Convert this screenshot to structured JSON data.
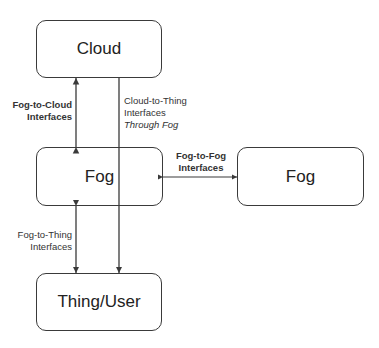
{
  "diagram": {
    "nodes": {
      "cloud": {
        "label": "Cloud"
      },
      "fog_left": {
        "label": "Fog"
      },
      "fog_right": {
        "label": "Fog"
      },
      "thing_user": {
        "label": "Thing/User"
      }
    },
    "edges": {
      "fog_to_cloud": {
        "line1": "Fog-to-Cloud",
        "line2": "Interfaces"
      },
      "cloud_to_thing": {
        "line1": "Cloud-to-Thing",
        "line2": "Interfaces",
        "line3": "Through Fog"
      },
      "fog_to_fog": {
        "line1": "Fog-to-Fog",
        "line2": "Interfaces"
      },
      "fog_to_thing": {
        "line1": "Fog-to-Thing",
        "line2": "Interfaces"
      }
    },
    "colors": {
      "stroke": "#3a3a3a",
      "text": "#222222",
      "background": "#ffffff"
    }
  }
}
